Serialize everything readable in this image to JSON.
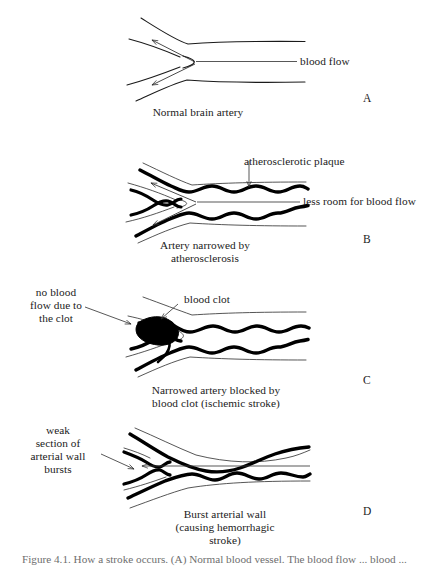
{
  "figure": {
    "type": "medical-illustration",
    "background_color": "#ffffff",
    "ink_color": "#1a1a1a",
    "panels": [
      {
        "letter": "A",
        "caption": "Normal brain artery",
        "labels": [
          {
            "name": "blood-flow",
            "text": "blood flow",
            "lines": [
              "blood flow"
            ]
          }
        ]
      },
      {
        "letter": "B",
        "caption_lines": [
          "Artery narrowed by",
          "atherosclerosis"
        ],
        "labels": [
          {
            "name": "atherosclerotic-plaque",
            "text": "atherosclerotic plaque",
            "lines": [
              "atherosclerotic plaque"
            ]
          },
          {
            "name": "less-room-for-blood-flow",
            "text": "less room for blood flow",
            "lines": [
              "less room for blood flow"
            ]
          }
        ]
      },
      {
        "letter": "C",
        "caption_lines": [
          "Narrowed artery blocked by",
          "blood clot (ischemic stroke)"
        ],
        "labels": [
          {
            "name": "no-blood-flow-due-to-the-clot",
            "text": "no blood flow due to the clot",
            "lines": [
              "no blood",
              "flow due to",
              "the clot"
            ]
          },
          {
            "name": "blood-clot",
            "text": "blood clot",
            "lines": [
              "blood clot"
            ]
          }
        ]
      },
      {
        "letter": "D",
        "caption_lines": [
          "Burst arterial wall",
          "(causing hemorrhagic",
          "stroke)"
        ],
        "labels": [
          {
            "name": "weak-section-of-arterial-wall-bursts",
            "text": "weak section of arterial wall bursts",
            "lines": [
              "weak",
              "section of",
              "arterial wall",
              "bursts"
            ]
          }
        ]
      }
    ],
    "bottom_caption_partial": "Figure 4.1. How a stroke occurs. (A) Normal blood... The blood flow..."
  },
  "panelA": {
    "letter": "A",
    "caption": "Normal brain artery",
    "blood_flow_label": "blood flow"
  },
  "panelB": {
    "letter": "B",
    "caption_line1": "Artery narrowed by",
    "caption_line2": "atherosclerosis",
    "plaque_label": "atherosclerotic plaque",
    "less_room_label": "less room for blood flow"
  },
  "panelC": {
    "letter": "C",
    "caption_line1": "Narrowed artery blocked by",
    "caption_line2": "blood clot (ischemic stroke)",
    "no_flow_line1": "no blood",
    "no_flow_line2": "flow due to",
    "no_flow_line3": "the clot",
    "clot_label": "blood clot"
  },
  "panelD": {
    "letter": "D",
    "caption_line1": "Burst arterial wall",
    "caption_line2": "(causing hemorrhagic",
    "caption_line3": "stroke)",
    "weak_line1": "weak",
    "weak_line2": "section of",
    "weak_line3": "arterial wall",
    "weak_line4": "bursts"
  },
  "bottom": {
    "caption_partial": "Figure 4.1. How a stroke occurs. (A) Normal blood vessel. The blood flow ... blood ..."
  }
}
